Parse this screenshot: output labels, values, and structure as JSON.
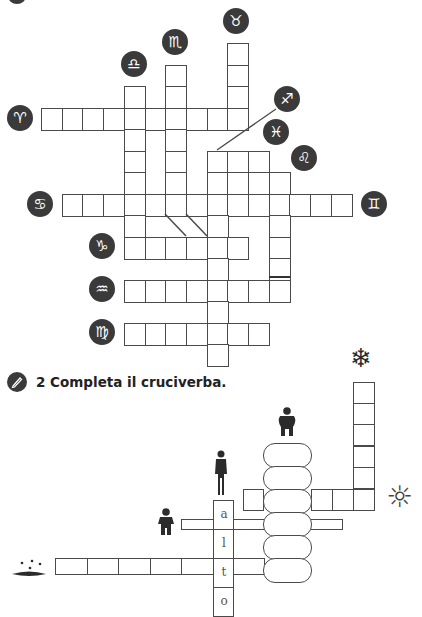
{
  "exercise1": {
    "cell": {
      "w": 20.7,
      "h": 21.5,
      "x0": 41,
      "y0": 43
    },
    "cells": [
      [
        0,
        9
      ],
      [
        1,
        6
      ],
      [
        1,
        9
      ],
      [
        2,
        4
      ],
      [
        2,
        6
      ],
      [
        2,
        9
      ],
      [
        3,
        0
      ],
      [
        3,
        1
      ],
      [
        3,
        2
      ],
      [
        3,
        3
      ],
      [
        3,
        4
      ],
      [
        3,
        5
      ],
      [
        3,
        6
      ],
      [
        3,
        7
      ],
      [
        3,
        8
      ],
      [
        3,
        9
      ],
      [
        4,
        4
      ],
      [
        4,
        6
      ],
      [
        5,
        4
      ],
      [
        5,
        6
      ],
      [
        5,
        8
      ],
      [
        5,
        9
      ],
      [
        5,
        10
      ],
      [
        6,
        4
      ],
      [
        6,
        6
      ],
      [
        6,
        8
      ],
      [
        6,
        9
      ],
      [
        6,
        10
      ],
      [
        6,
        11
      ],
      [
        7,
        1
      ],
      [
        7,
        2
      ],
      [
        7,
        3
      ],
      [
        7,
        4
      ],
      [
        7,
        5
      ],
      [
        7,
        6
      ],
      [
        7,
        7
      ],
      [
        7,
        8
      ],
      [
        7,
        9
      ],
      [
        7,
        10
      ],
      [
        7,
        11
      ],
      [
        7,
        12
      ],
      [
        7,
        13
      ],
      [
        7,
        14
      ],
      [
        8,
        4
      ],
      [
        8,
        8
      ],
      [
        8,
        11
      ],
      [
        9,
        4
      ],
      [
        9,
        5
      ],
      [
        9,
        6
      ],
      [
        9,
        7
      ],
      [
        9,
        8
      ],
      [
        9,
        9
      ],
      [
        9,
        11
      ],
      [
        10,
        8
      ],
      [
        10,
        11
      ],
      [
        11,
        4
      ],
      [
        11,
        5
      ],
      [
        11,
        6
      ],
      [
        11,
        7
      ],
      [
        11,
        8
      ],
      [
        11,
        9
      ],
      [
        11,
        10
      ],
      [
        11,
        11
      ],
      [
        12,
        8
      ],
      [
        13,
        4
      ],
      [
        13,
        5
      ],
      [
        13,
        6
      ],
      [
        13,
        7
      ],
      [
        13,
        8
      ],
      [
        13,
        9
      ],
      [
        13,
        10
      ],
      [
        14,
        8
      ]
    ],
    "zodiac_badges": [
      {
        "name": "taurus",
        "glyph": "♉",
        "x": 223,
        "y": 8
      },
      {
        "name": "scorpio",
        "glyph": "♏",
        "x": 162,
        "y": 29
      },
      {
        "name": "libra",
        "glyph": "♎",
        "x": 121,
        "y": 51
      },
      {
        "name": "aries",
        "glyph": "♈",
        "x": 7,
        "y": 105
      },
      {
        "name": "sagittarius",
        "glyph": "♐",
        "x": 274,
        "y": 86
      },
      {
        "name": "pisces",
        "glyph": "♓",
        "x": 263,
        "y": 119
      },
      {
        "name": "leo",
        "glyph": "♌",
        "x": 291,
        "y": 145
      },
      {
        "name": "cancer",
        "glyph": "♋",
        "x": 27,
        "y": 191
      },
      {
        "name": "gemini",
        "glyph": "♊",
        "x": 361,
        "y": 191
      },
      {
        "name": "capricorn",
        "glyph": "♑",
        "x": 89,
        "y": 233
      },
      {
        "name": "aquarius",
        "glyph": "♒",
        "x": 89,
        "y": 276
      },
      {
        "name": "virgo",
        "glyph": "♍",
        "x": 89,
        "y": 319
      }
    ]
  },
  "exercise2": {
    "heading": "2 Completa il cruciverba.",
    "letters": [
      "a",
      "l",
      "t",
      "o"
    ],
    "icons": {
      "snowflake": "❄",
      "sun": "☼",
      "rain": "rain-puddle"
    }
  }
}
